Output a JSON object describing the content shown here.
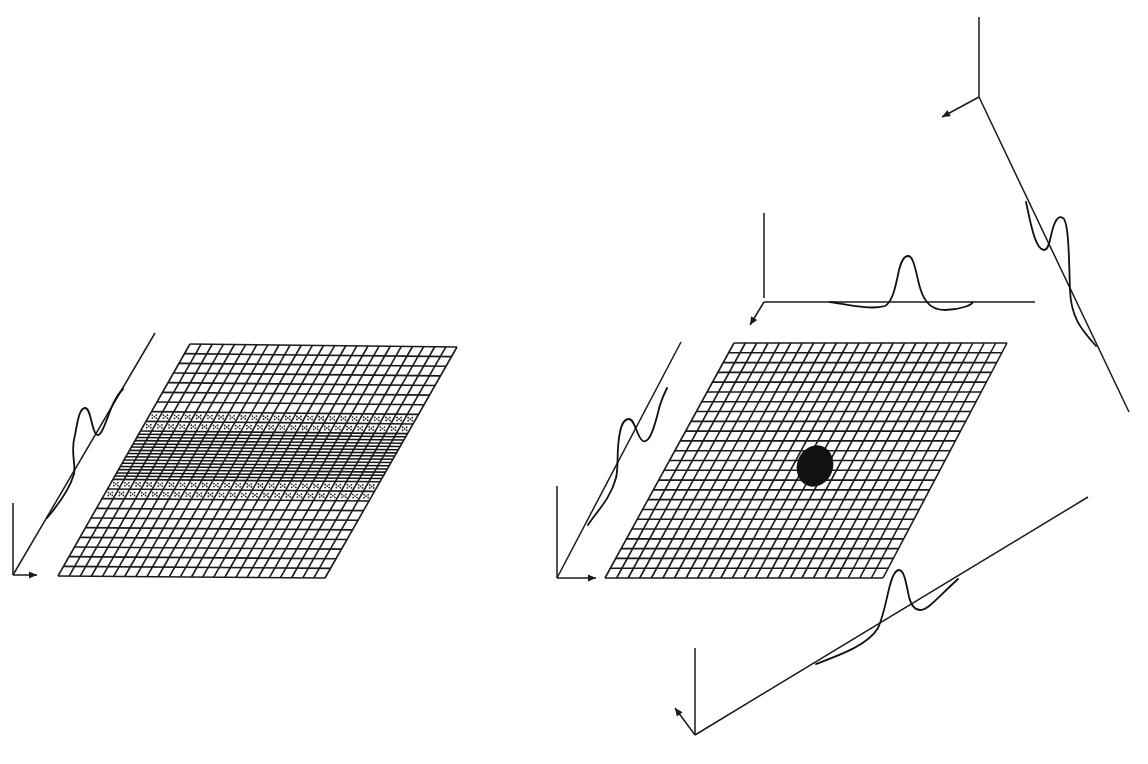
{
  "figure": {
    "colors": {
      "line": "#1a1a1a",
      "background": "#ffffff",
      "blob": "#111111"
    }
  },
  "left_panel": {
    "grid": {
      "corners": {
        "tl": [
          190,
          344
        ],
        "tr": [
          457,
          347
        ],
        "bl": [
          58,
          576
        ],
        "br": [
          325,
          578
        ]
      },
      "cols": 24,
      "rows": 24,
      "band": {
        "dotted_rows": [
          7,
          8,
          14,
          15
        ],
        "dense_rows": [
          9,
          10,
          11,
          12,
          13
        ],
        "dense_extra_lines": 2
      }
    },
    "axis": {
      "origin": [
        13,
        575
      ],
      "vertical_top": [
        13,
        503
      ],
      "arrow_x_end": [
        37,
        575
      ],
      "diagonal_end": [
        155,
        333
      ]
    },
    "profile_curve": "M47,518 C58,505 70,488 74,474 C76,462 70,452 75,435 C78,418 80,408 85,408 C91,408 91,428 96,434 C101,440 106,420 113,404 C117,396 121,391 123,389"
  },
  "right_panel": {
    "grid": {
      "corners": {
        "tl": [
          734,
          343
        ],
        "tr": [
          1007,
          343
        ],
        "bl": [
          605,
          578
        ],
        "br": [
          883,
          578
        ]
      },
      "cols": 24,
      "rows": 24,
      "blob": {
        "cx": 815,
        "cy": 466,
        "rx": 18,
        "ry": 21,
        "rotate": 20
      }
    },
    "axes": {
      "left": {
        "origin": [
          557,
          578
        ],
        "vertical_top": [
          557,
          486
        ],
        "arrow_x_end": [
          596,
          578
        ],
        "diagonal_end": [
          681,
          342
        ],
        "profile_curve": "M588,525 C596,512 610,500 616,478 C619,466 616,450 620,432 C622,422 625,419 629,419 C635,419 637,438 643,441 C650,444 655,425 660,405 C663,396 665,392 667,388"
      },
      "top": {
        "origin": [
          764,
          302
        ],
        "vertical_top": [
          764,
          213
        ],
        "horizontal_end": [
          1035,
          302
        ],
        "arrow_end": [
          750,
          325
        ],
        "profile_curve": "M830,302 C850,305 870,310 885,306 C892,302 895,290 899,270 C902,258 905,256 908,256 C912,256 914,262 918,280 C922,298 928,310 945,310 C960,310 975,304 972,302"
      },
      "topright": {
        "vertical_top": [
          979,
          17
        ],
        "origin": [
          979,
          97
        ],
        "arrow_end": [
          942,
          117
        ],
        "diagonal_end": [
          1129,
          412
        ],
        "profile_curve": "M1026,202 C1030,220 1035,250 1044,250 C1050,250 1050,235 1054,225 C1057,217 1060,216 1063,218 C1069,222 1069,262 1070,290 C1071,320 1084,332 1096,346"
      },
      "bottom": {
        "origin": [
          695,
          735
        ],
        "vertical_top": [
          695,
          648
        ],
        "arrow_end": [
          675,
          708
        ],
        "diagonal_end": [
          1088,
          497
        ],
        "profile_curve": "M816,664 C840,655 868,645 878,628 C884,615 886,600 890,585 C893,574 896,570 899,570 C904,570 906,582 909,597 C912,608 916,610 920,610 C928,610 935,600 958,579"
      }
    }
  }
}
